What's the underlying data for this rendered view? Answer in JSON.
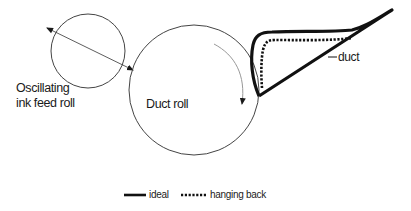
{
  "diagram": {
    "labels": {
      "oscillating_line1": "Oscillating",
      "oscillating_line2": "ink feed roll",
      "duct_roll": "Duct roll",
      "duct": "duct"
    },
    "legend": {
      "ideal": "ideal",
      "hanging_back": "hanging back"
    },
    "colors": {
      "stroke": "#1a1a1a",
      "circle": "#444444",
      "rotation_arrow": "#999999"
    }
  }
}
